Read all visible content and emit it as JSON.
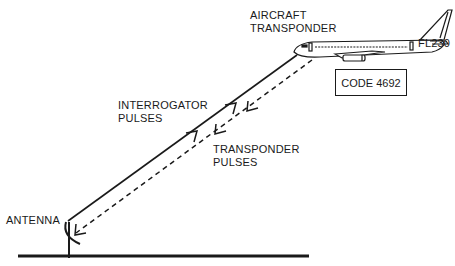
{
  "labels": {
    "aircraft_line1": "AIRCRAFT",
    "aircraft_line2": "TRANSPONDER",
    "flight_level": "FL230",
    "code": "CODE 4692",
    "interrogator_line1": "INTERROGATOR",
    "interrogator_line2": "PULSES",
    "transponder_line1": "TRANSPONDER",
    "transponder_line2": "PULSES",
    "antenna": "ANTENNA"
  },
  "colors": {
    "ink": "#1a1a1a",
    "background": "#ffffff"
  }
}
